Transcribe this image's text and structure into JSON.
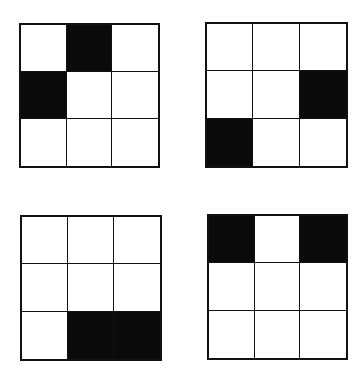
{
  "figure": {
    "fill_color": "#0a0a0a",
    "empty_color": "#ffffff",
    "line_color": "#111111",
    "grids": [
      {
        "id": "grid-1",
        "position": "top-left",
        "rows": 3,
        "cols": 3,
        "cells": [
          [
            0,
            1,
            0
          ],
          [
            1,
            0,
            0
          ],
          [
            0,
            0,
            0
          ]
        ]
      },
      {
        "id": "grid-2",
        "position": "top-right",
        "rows": 3,
        "cols": 3,
        "cells": [
          [
            0,
            0,
            0
          ],
          [
            0,
            0,
            1
          ],
          [
            1,
            0,
            0
          ]
        ]
      },
      {
        "id": "grid-3",
        "position": "bottom-left",
        "rows": 3,
        "cols": 3,
        "cells": [
          [
            0,
            0,
            0
          ],
          [
            0,
            0,
            0
          ],
          [
            0,
            1,
            1
          ]
        ]
      },
      {
        "id": "grid-4",
        "position": "bottom-right",
        "rows": 3,
        "cols": 3,
        "cells": [
          [
            1,
            0,
            1
          ],
          [
            0,
            0,
            0
          ],
          [
            0,
            0,
            0
          ]
        ]
      }
    ]
  }
}
